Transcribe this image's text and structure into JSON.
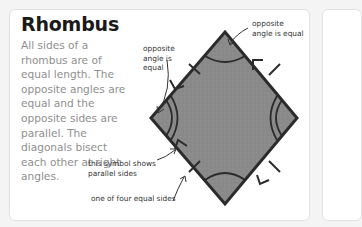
{
  "card": {
    "title": "Rhombus",
    "description": "All sides of a rhombus are of equal length. The opposite angles are equal and the opposite sides are parallel. The diagonals bisect each other at right angles."
  },
  "annotations": {
    "top_right": "opposite\nangle is equal",
    "left": "opposite\nangle is\nequal",
    "parallel_symbol": "this symbol shows\nparallel sides",
    "equal_side": "one of four equal sides"
  },
  "diagram": {
    "shape": "rhombus",
    "vertices": {
      "top": [
        225,
        32
      ],
      "left": [
        151,
        118
      ],
      "right": [
        297,
        118
      ],
      "bottom": [
        225,
        204
      ]
    },
    "fill_color": "#8a8a8a",
    "stroke_color": "#2b2b2b",
    "equal_side_marks": 4,
    "parallel_arrow_marks": 4,
    "angle_arcs": {
      "single_arc": [
        "top",
        "bottom"
      ],
      "double_arc": [
        "left",
        "right"
      ]
    }
  },
  "colors": {
    "background": "#f4f4f4",
    "card": "#ffffff",
    "title": "#1a1a1a",
    "body_text": "#8f8f8f",
    "label_text": "#333333"
  }
}
